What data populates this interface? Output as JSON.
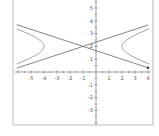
{
  "chart_data": {
    "type": "line",
    "title": "",
    "xlabel": "",
    "ylabel": "",
    "xlim": [
      -6.25,
      4.25
    ],
    "ylim": [
      -4.0,
      5.6
    ],
    "grid": false,
    "legend": "none",
    "x_ticks": [
      -5,
      -4,
      -3,
      -2,
      -1,
      1,
      2,
      3,
      4
    ],
    "y_ticks": [
      -3,
      -2,
      -1,
      1,
      2,
      3,
      4,
      5
    ],
    "series": [
      {
        "name": "hyperbola",
        "equation": "(x+1)^2/9 - (y-2)^2 = 1",
        "center": [
          -1,
          2
        ],
        "a": 3,
        "b": 1,
        "vertices": [
          [
            -4,
            2
          ],
          [
            2,
            2
          ]
        ],
        "color": "#888888"
      },
      {
        "name": "asymptote-rising",
        "equation": "y = 2 + (x+1)/3",
        "slope": 0.3333,
        "intercept": 2.3333,
        "color": "#666666"
      },
      {
        "name": "asymptote-falling",
        "equation": "y = 2 - (x+1)/3",
        "slope": -0.3333,
        "intercept": 1.6667,
        "color": "#666666"
      }
    ],
    "annotations": [
      {
        "type": "point",
        "x": 4,
        "y": 0.3333,
        "color": "#333333"
      }
    ],
    "colors": {
      "axis": "#777777",
      "frame": "#aaaaaa",
      "label": "#555555"
    }
  }
}
